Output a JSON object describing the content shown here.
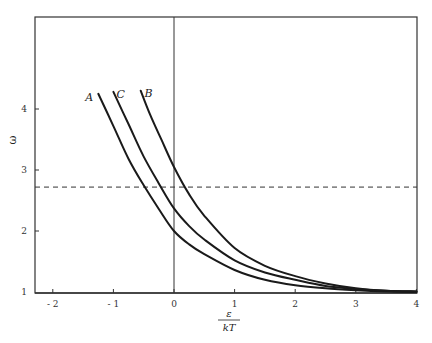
{
  "chart_data": {
    "type": "line",
    "title": "",
    "xlabel": "ε / kT",
    "xlabel_numerator": "ε",
    "xlabel_denominator": "kT",
    "ylabel": "ω",
    "xlim": [
      -2.3,
      4
    ],
    "ylim": [
      1,
      4.3
    ],
    "x_ticks": [
      -2,
      -1,
      0,
      1,
      2,
      3,
      4
    ],
    "y_ticks": [
      1,
      2,
      3,
      4
    ],
    "grid": false,
    "legend": "inline curve labels",
    "vertical_reference_line": {
      "x": 0,
      "style": "solid"
    },
    "horizontal_reference_line": {
      "y": 2.72,
      "style": "dashed",
      "annotation": ""
    },
    "series": [
      {
        "name": "A",
        "x": [
          -1.25,
          -1.0,
          -0.75,
          -0.5,
          -0.25,
          0,
          0.25,
          0.5,
          1.0,
          1.5,
          2.0,
          2.5,
          3.0,
          3.5,
          4.0
        ],
        "y": [
          4.25,
          3.72,
          3.18,
          2.75,
          2.36,
          2.0,
          1.78,
          1.62,
          1.36,
          1.2,
          1.11,
          1.06,
          1.03,
          1.01,
          1.0
        ]
      },
      {
        "name": "C",
        "x": [
          -1.0,
          -0.75,
          -0.5,
          -0.25,
          0,
          0.25,
          0.5,
          1.0,
          1.5,
          2.0,
          2.5,
          3.0,
          3.5,
          4.0
        ],
        "y": [
          4.28,
          3.75,
          3.22,
          2.78,
          2.37,
          2.08,
          1.86,
          1.52,
          1.32,
          1.2,
          1.1,
          1.05,
          1.02,
          1.01
        ]
      },
      {
        "name": "B",
        "x": [
          -0.55,
          -0.4,
          -0.2,
          0,
          0.25,
          0.5,
          1.0,
          1.5,
          2.0,
          2.5,
          3.0,
          3.5,
          4.0
        ],
        "y": [
          4.3,
          3.92,
          3.48,
          3.05,
          2.6,
          2.25,
          1.72,
          1.43,
          1.26,
          1.14,
          1.06,
          1.02,
          1.01
        ]
      }
    ],
    "annotations": [
      {
        "text": "A",
        "x": -1.4,
        "y": 4.2
      },
      {
        "text": "C",
        "x": -0.88,
        "y": 4.25
      },
      {
        "text": "B",
        "x": -0.42,
        "y": 4.27
      }
    ]
  },
  "plot_box": {
    "left": 35,
    "top": 17,
    "right": 417,
    "bottom": 293
  },
  "colors": {
    "line": "#1a1a1a",
    "axis": "#333333",
    "background": "#ffffff"
  }
}
